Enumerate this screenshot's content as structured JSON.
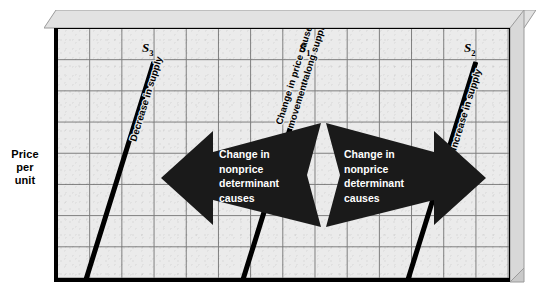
{
  "figure": {
    "y_axis_label": "Price\nper\nunit",
    "background": "#ebebeb",
    "grid_color": "#777777",
    "curve_color": "#000000",
    "arrow_color": "#1a1a1a",
    "arrow_text_color": "#ffffff"
  },
  "curves": [
    {
      "id": "s3",
      "series_label": "S",
      "subscript": "3",
      "annotation": "Decrease in supply",
      "x1": 28,
      "y1": 250,
      "x2": 96,
      "y2": 32
    },
    {
      "id": "s1",
      "series_label": "S",
      "subscript": "1",
      "annotation": "Change in price causes\nmovement along supply curve",
      "annotation_line1": "Change in price causes",
      "annotation_line2": "movement along supply curve",
      "x1": 185,
      "y1": 250,
      "x2": 253,
      "y2": 32
    },
    {
      "id": "s2",
      "series_label": "S",
      "subscript": "2",
      "annotation": "Increase in supply",
      "x1": 350,
      "y1": 250,
      "x2": 418,
      "y2": 32
    }
  ],
  "arrows": [
    {
      "id": "left-arrow",
      "direction": "left",
      "text": "Change in\nnonprice\ndeterminant\ncauses",
      "lines": [
        "Change in",
        "nonprice",
        "determinant",
        "causes"
      ]
    },
    {
      "id": "right-arrow",
      "direction": "right",
      "text": "Change in\nnonprice\ndeterminant\ncauses",
      "lines": [
        "Change in",
        "nonprice",
        "determinant",
        "causes"
      ]
    }
  ],
  "chart_data": {
    "type": "line",
    "title": "",
    "xlabel": "",
    "ylabel": "Price per unit",
    "grid": true,
    "legend": "none",
    "xlim": [
      0,
      14
    ],
    "ylim": [
      0,
      8
    ],
    "series": [
      {
        "name": "S3",
        "label": "Decrease in supply",
        "x": [
          0.85,
          2.95
        ],
        "y": [
          0.15,
          7.0
        ],
        "note": "Leftward shift of supply curve"
      },
      {
        "name": "S1",
        "label": "Change in price causes movement along supply curve",
        "x": [
          5.75,
          7.85
        ],
        "y": [
          0.15,
          7.0
        ],
        "note": "Original supply curve"
      },
      {
        "name": "S2",
        "label": "Increase in supply",
        "x": [
          10.9,
          13.0
        ],
        "y": [
          0.15,
          7.0
        ],
        "note": "Rightward shift of supply curve"
      }
    ],
    "annotations": [
      "Change in nonprice determinant causes",
      "Change in nonprice determinant causes"
    ]
  }
}
